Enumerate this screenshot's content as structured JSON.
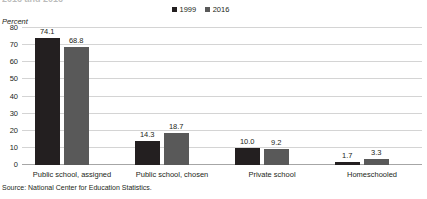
{
  "chart_data": {
    "type": "bar",
    "title": "2016 and 2016",
    "categories": [
      "Public school, assigned",
      "Public school, chosen",
      "Private school",
      "Homeschooled"
    ],
    "series": [
      {
        "name": "1999",
        "color": "#231f20",
        "values": [
          74.1,
          14.3,
          10.0,
          1.7
        ],
        "labels": [
          "74.1",
          "14.3",
          "10.0",
          "1.7"
        ]
      },
      {
        "name": "2016",
        "color": "#595959",
        "values": [
          68.8,
          18.7,
          9.2,
          3.3
        ],
        "labels": [
          "68.8",
          "18.7",
          "9.2",
          "3.3"
        ]
      }
    ],
    "xlabel": "",
    "ylabel": "Percent",
    "ylim": [
      0,
      80
    ],
    "yticks": [
      80,
      70,
      60,
      50,
      40,
      30,
      20,
      10,
      0
    ],
    "ytick_labels": [
      "80",
      "70",
      "60",
      "50",
      "40",
      "30",
      "20",
      "10",
      "0"
    ],
    "grid": true,
    "legend_position": "top-center",
    "source": "Source: National Center for Education Statistics."
  }
}
